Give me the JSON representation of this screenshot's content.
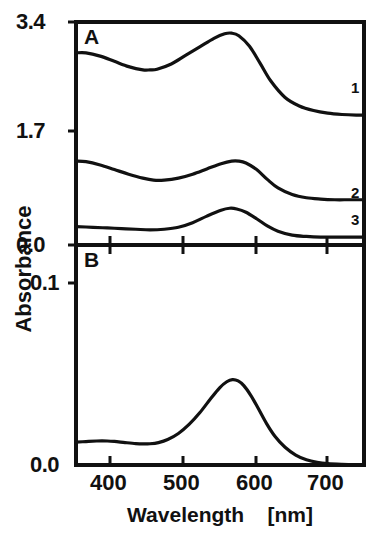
{
  "figure": {
    "axis_title_y": "Absorbance",
    "axis_title_x": "Wavelength    [nm]",
    "panel_a_label": "A",
    "panel_b_label": "B"
  },
  "panel_a": {
    "label": "A",
    "y_ticks": [
      {
        "value": 3.4,
        "text": "3.4",
        "py": 22
      },
      {
        "value": 1.7,
        "text": "1.7",
        "py": 131
      },
      {
        "value": 0.0,
        "text": "0.0",
        "py": 245
      }
    ],
    "curve_labels": [
      {
        "text": "1",
        "px": 351,
        "py": 86
      },
      {
        "text": "2",
        "px": 351,
        "py": 191
      },
      {
        "text": "3",
        "px": 351,
        "py": 218
      }
    ]
  },
  "panel_b": {
    "label": "B",
    "y_ticks": [
      {
        "value": 0.1,
        "text": "0.1",
        "py": 283
      },
      {
        "value": 0.0,
        "text": "0.0",
        "py": 465
      }
    ]
  },
  "x_axis": {
    "ticks": [
      {
        "value": 400,
        "text": "400",
        "px": 110
      },
      {
        "value": 500,
        "text": "500",
        "px": 183
      },
      {
        "value": 600,
        "text": "600",
        "px": 256
      },
      {
        "value": 700,
        "text": "700",
        "px": 327
      }
    ],
    "range_nm": [
      346,
      751
    ]
  },
  "chart_data": {
    "type": "line",
    "title": "",
    "xlabel": "Wavelength    [nm]",
    "ylabel": "Absorbance",
    "xlim": [
      346,
      751
    ],
    "grid": false,
    "legend": "inline-right-end-labels",
    "panels": [
      {
        "panel": "A",
        "ylim": [
          0.0,
          3.4
        ],
        "yticks": [
          0.0,
          1.7,
          3.4
        ],
        "series": [
          {
            "name": "1",
            "x": [
              346,
              360,
              380,
              400,
              420,
              440,
              450,
              460,
              480,
              500,
              520,
              540,
              555,
              565,
              575,
              590,
              605,
              620,
              640,
              660,
              680,
              700,
              720,
              740,
              751
            ],
            "values": [
              2.93,
              2.93,
              2.88,
              2.8,
              2.72,
              2.67,
              2.67,
              2.68,
              2.76,
              2.89,
              3.02,
              3.15,
              3.22,
              3.23,
              3.19,
              3.03,
              2.77,
              2.5,
              2.25,
              2.12,
              2.05,
              2.01,
              1.99,
              1.98,
              1.98
            ]
          },
          {
            "name": "2",
            "x": [
              346,
              360,
              380,
              400,
              420,
              440,
              455,
              470,
              490,
              510,
              530,
              550,
              565,
              575,
              585,
              600,
              615,
              630,
              650,
              670,
              690,
              710,
              730,
              751
            ],
            "values": [
              1.28,
              1.27,
              1.22,
              1.15,
              1.08,
              1.02,
              0.99,
              0.99,
              1.02,
              1.08,
              1.16,
              1.24,
              1.28,
              1.28,
              1.25,
              1.15,
              1.0,
              0.87,
              0.77,
              0.72,
              0.7,
              0.69,
              0.69,
              0.69
            ]
          },
          {
            "name": "3",
            "x": [
              346,
              370,
              390,
              410,
              430,
              450,
              470,
              490,
              510,
              530,
              550,
              562,
              572,
              585,
              600,
              615,
              630,
              650,
              670,
              690,
              710,
              730,
              751
            ],
            "values": [
              0.28,
              0.27,
              0.26,
              0.25,
              0.24,
              0.23,
              0.24,
              0.27,
              0.34,
              0.44,
              0.53,
              0.56,
              0.55,
              0.5,
              0.4,
              0.29,
              0.21,
              0.15,
              0.13,
              0.12,
              0.12,
              0.12,
              0.12
            ]
          }
        ]
      },
      {
        "panel": "B",
        "ylim": [
          0.0,
          0.255
        ],
        "yticks": [
          0.0,
          0.1
        ],
        "series": [
          {
            "name": "B",
            "x": [
              346,
              360,
              375,
              390,
              400,
              415,
              430,
              440,
              450,
              462,
              475,
              490,
              505,
              520,
              535,
              548,
              558,
              566,
              574,
              582,
              592,
              602,
              614,
              626,
              640,
              655,
              670,
              685,
              700,
              720,
              740,
              751
            ],
            "values": [
              0.0265,
              0.0272,
              0.0278,
              0.0278,
              0.0273,
              0.026,
              0.0248,
              0.0244,
              0.0246,
              0.026,
              0.0295,
              0.0365,
              0.047,
              0.0605,
              0.0765,
              0.0895,
              0.0965,
              0.099,
              0.0975,
              0.092,
              0.0805,
              0.066,
              0.048,
              0.033,
              0.0205,
              0.0115,
              0.006,
              0.003,
              0.0015,
              0.0008,
              0.0005,
              0.0005
            ]
          }
        ]
      }
    ]
  },
  "style": {
    "line_color": "#111111",
    "frame_color": "#111111",
    "background": "#ffffff"
  }
}
